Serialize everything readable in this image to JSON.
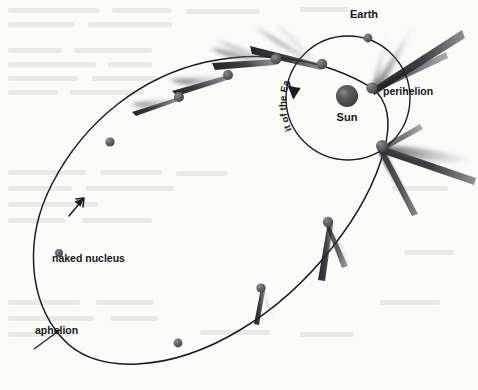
{
  "figure": {
    "background_color": "#fbfbfa",
    "ink_color": "#1a1b1f"
  },
  "labels": {
    "earth": "Earth",
    "sun": "Sun",
    "perihelion": "perihelion",
    "aphelion": "aphelion",
    "naked_nucleus": "naked nucleus",
    "orbit_of_the_earth": "orbit of the Earth"
  },
  "orbit_of_earth_chars": [
    "o",
    "r",
    "b",
    "i",
    "t",
    " ",
    "o",
    "f",
    " ",
    "t",
    "h",
    "e",
    " ",
    "E",
    "a",
    "r",
    "t",
    "h"
  ],
  "bodies": {
    "sun": {
      "cx": 347,
      "cy": 96,
      "r": 11,
      "color": "#4a4a4d",
      "highlight": "#6f6f73"
    },
    "earth": {
      "cx": 368,
      "cy": 38,
      "r": 4.2,
      "color": "#55565a"
    }
  },
  "earth_orbit": {
    "cx": 348,
    "cy": 98,
    "r": 62,
    "stroke": "#1a1b1f"
  },
  "comet_positions": [
    {
      "id": "p1",
      "cx": 59,
      "cy": 253,
      "r": 4.0,
      "tail": 0,
      "label": "naked-nucleus"
    },
    {
      "id": "p2",
      "cx": 110,
      "cy": 142,
      "r": 4.6,
      "tail": 0
    },
    {
      "id": "p3",
      "cx": 179,
      "cy": 97,
      "r": 5.0,
      "tail": 1
    },
    {
      "id": "p4",
      "cx": 228,
      "cy": 75,
      "r": 5.0,
      "tail": 1
    },
    {
      "id": "p5",
      "cx": 276,
      "cy": 59,
      "r": 5.4,
      "tail": 1
    },
    {
      "id": "p6",
      "cx": 322,
      "cy": 64,
      "r": 5.2,
      "tail": 1
    },
    {
      "id": "p7",
      "cx": 372,
      "cy": 88,
      "r": 5.6,
      "tail": 1,
      "label": "perihelion"
    },
    {
      "id": "p8",
      "cx": 382,
      "cy": 146,
      "r": 6.0,
      "tail": 1
    },
    {
      "id": "p9",
      "cx": 328,
      "cy": 222,
      "r": 5.2,
      "tail": 1
    },
    {
      "id": "p10",
      "cx": 261,
      "cy": 288,
      "r": 4.6,
      "tail": 1
    },
    {
      "id": "p11",
      "cx": 178,
      "cy": 343,
      "r": 4.4,
      "tail": 0
    }
  ],
  "arrows": {
    "comet_direction": "up-right along ellipse at left",
    "earth_direction": "clockwise arrowhead at top-left of Earth orbit"
  }
}
